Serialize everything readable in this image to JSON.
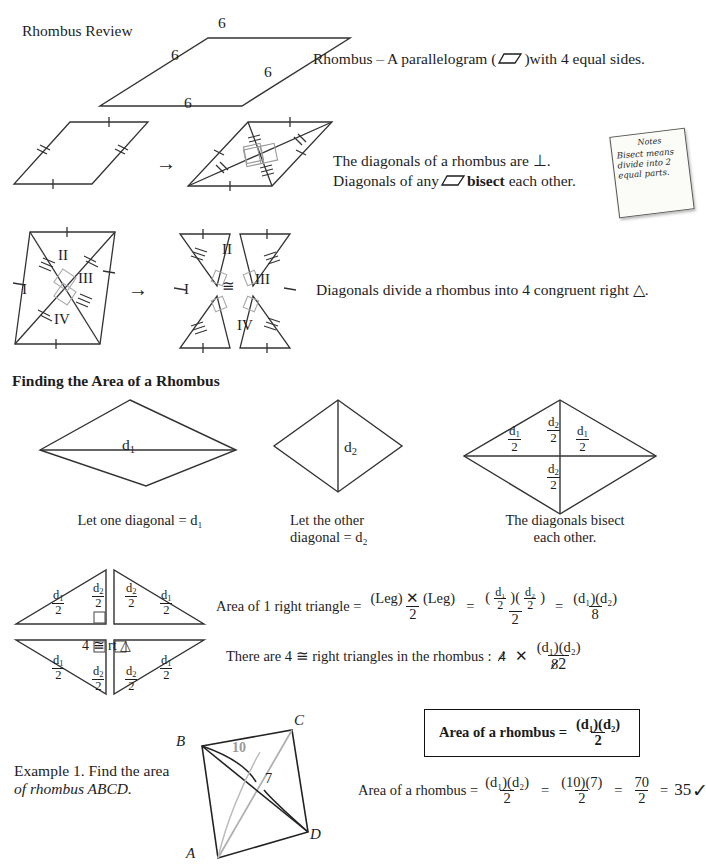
{
  "page": {
    "title": "Rhombus Review",
    "background": "#ffffff",
    "ink": "#1d1d1d"
  },
  "section_definition": {
    "heading": "Rhombus Review",
    "figure_side_labels": [
      "6",
      "6",
      "6",
      "6"
    ],
    "definition_parts": {
      "lead": "Rhombus – A parallelogram (",
      "icon": "parallelogram-icon",
      "tail": ")with 4 equal sides."
    }
  },
  "section_diagonals": {
    "line1": "The diagonals of a rhombus are ⊥.",
    "line2_a": "Diagonals of any",
    "line2_icon": "parallelogram-icon",
    "line2_b": "bisect",
    "line2_c": "each other.",
    "arrow": "→"
  },
  "sticky_note": {
    "title": "Notes",
    "lines": [
      "Bisect means",
      "divide into 2",
      "equal parts."
    ]
  },
  "section_congruent": {
    "triangle_labels": [
      "I",
      "II",
      "III",
      "IV"
    ],
    "congruent_symbol": "≅",
    "arrow": "→",
    "text": "Diagonals divide a rhombus into 4 congruent right △."
  },
  "section_area": {
    "heading": "Finding the Area of a Rhombus",
    "figures": [
      {
        "name": "rhombus-d1",
        "inner_label": "d₁",
        "caption": "Let one diagonal = d₁"
      },
      {
        "name": "rhombus-d2",
        "inner_label": "d₂",
        "caption_line1": "Let the other",
        "caption_line2": "diagonal = d₂"
      },
      {
        "name": "rhombus-halves",
        "labels": [
          {
            "num": "d₁",
            "den": "2"
          },
          {
            "num": "d₂",
            "den": "2"
          },
          {
            "num": "d₁",
            "den": "2"
          },
          {
            "num": "d₂",
            "den": "2"
          }
        ],
        "caption_line1": "The diagonals bisect",
        "caption_line2": "each other."
      }
    ]
  },
  "section_derivation": {
    "exploded_figure": {
      "name": "four-right-triangles",
      "center_label": "4 ≅ rt △",
      "labels": [
        {
          "num": "d₁",
          "den": "2"
        },
        {
          "num": "d₂",
          "den": "2"
        },
        {
          "num": "d₂",
          "den": "2"
        },
        {
          "num": "d₁",
          "den": "2"
        },
        {
          "num": "d₁",
          "den": "2"
        },
        {
          "num": "d₂",
          "den": "2"
        },
        {
          "num": "d₂",
          "den": "2"
        },
        {
          "num": "d₁",
          "den": "2"
        }
      ]
    },
    "equation1": {
      "lead": "Area of 1 right triangle  = ",
      "f1_num": "(Leg) ✕ (Leg)",
      "f1_den": "2",
      "eq1": "=",
      "f2_num_a": "d₁",
      "f2_num_a_den": "2",
      "f2_num_b": "d₂",
      "f2_num_b_den": "2",
      "f2_den": "2",
      "eq2": "=",
      "f3_num": "(d₁)(d₂)",
      "f3_den": "8"
    },
    "equation2": {
      "lead": "There are 4 ≅ right triangles in the rhombus :",
      "cancelled_four": "4",
      "times": "✕",
      "num": "(d₁)(d₂)",
      "cancelled_den": "8",
      "replacement_den": "2"
    },
    "boxed_formula": {
      "label": "Area of a rhombus   = ",
      "num": "(d₁)(d₂)",
      "den": "2"
    }
  },
  "section_example": {
    "prompt_line1": "Example 1. Find the area",
    "prompt_line2": "of rhombus ABCD.",
    "figure": {
      "name": "rhombus-abcd",
      "vertex_labels": [
        "A",
        "B",
        "C",
        "D"
      ],
      "diagonal_ac_label": "10",
      "diagonal_ac_color": "#9a9a9a",
      "diagonal_bd_label": "7"
    },
    "solution": {
      "lead": "Area of a rhombus = ",
      "f1_num": "(d₁)(d₂)",
      "f1_den": "2",
      "eq1": "=",
      "f2_num": "(10)(7)",
      "f2_den": "2",
      "eq2": "=",
      "f3_num": "70",
      "f3_den": "2",
      "eq3": "=",
      "result": "35",
      "check": "✓"
    }
  }
}
